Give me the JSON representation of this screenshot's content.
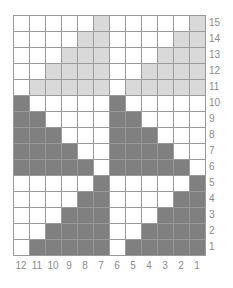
{
  "chart_data": {
    "type": "heatmap",
    "title": "",
    "xlabel": "",
    "ylabel": "",
    "columns": 12,
    "rows": 15,
    "x_tick_labels": [
      "12",
      "11",
      "10",
      "9",
      "8",
      "7",
      "6",
      "5",
      "4",
      "3",
      "2",
      "1"
    ],
    "y_tick_labels": [
      "15",
      "14",
      "13",
      "12",
      "11",
      "10",
      "9",
      "8",
      "7",
      "6",
      "5",
      "4",
      "3",
      "2",
      "1"
    ],
    "legend": [
      {
        "value": 0,
        "label": "empty",
        "color": "#ffffff"
      },
      {
        "value": 1,
        "label": "light-shade",
        "color": "#d9d9d9"
      },
      {
        "value": 2,
        "label": "dark-shade",
        "color": "#808080"
      }
    ],
    "grid": true,
    "grid_color": "#9a9a9a",
    "label_color": "#8c8c8c",
    "row_order": "top-to-bottom-15-to-1",
    "column_order": "left-to-right-12-to-1",
    "values": [
      [
        0,
        0,
        0,
        0,
        0,
        1,
        0,
        0,
        0,
        0,
        0,
        1
      ],
      [
        0,
        0,
        0,
        0,
        1,
        1,
        0,
        0,
        0,
        0,
        1,
        1
      ],
      [
        0,
        0,
        0,
        1,
        1,
        1,
        0,
        0,
        0,
        1,
        1,
        1
      ],
      [
        0,
        0,
        1,
        1,
        1,
        1,
        0,
        0,
        1,
        1,
        1,
        1
      ],
      [
        0,
        1,
        1,
        1,
        1,
        1,
        0,
        1,
        1,
        1,
        1,
        1
      ],
      [
        2,
        0,
        0,
        0,
        0,
        0,
        2,
        0,
        0,
        0,
        0,
        0
      ],
      [
        2,
        2,
        0,
        0,
        0,
        0,
        2,
        2,
        0,
        0,
        0,
        0
      ],
      [
        2,
        2,
        2,
        0,
        0,
        0,
        2,
        2,
        2,
        0,
        0,
        0
      ],
      [
        2,
        2,
        2,
        2,
        0,
        0,
        2,
        2,
        2,
        2,
        0,
        0
      ],
      [
        2,
        2,
        2,
        2,
        2,
        0,
        2,
        2,
        2,
        2,
        2,
        0
      ],
      [
        0,
        0,
        0,
        0,
        0,
        2,
        0,
        0,
        0,
        0,
        0,
        2
      ],
      [
        0,
        0,
        0,
        0,
        2,
        2,
        0,
        0,
        0,
        0,
        2,
        2
      ],
      [
        0,
        0,
        0,
        2,
        2,
        2,
        0,
        0,
        0,
        2,
        2,
        2
      ],
      [
        0,
        0,
        2,
        2,
        2,
        2,
        0,
        0,
        2,
        2,
        2,
        2
      ],
      [
        0,
        2,
        2,
        2,
        2,
        2,
        0,
        2,
        2,
        2,
        2,
        2
      ]
    ]
  }
}
